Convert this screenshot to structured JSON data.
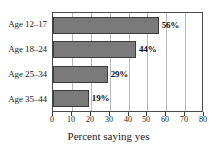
{
  "chart_data": {
    "type": "bar",
    "orientation": "horizontal",
    "title": "",
    "subtitle": "",
    "categories": [
      "Age 12–17",
      "Age 18–24",
      "Age 25–34",
      "Age 35–44"
    ],
    "values": [
      56,
      44,
      29,
      19
    ],
    "value_labels": [
      "56%",
      "44%",
      "29%",
      "19%"
    ],
    "xlabel": "Percent saying yes",
    "ylabel": "",
    "xlim": [
      0,
      80
    ],
    "xticks": [
      0,
      10,
      20,
      30,
      40,
      50,
      60,
      70,
      80
    ],
    "xtick_labels": [
      "0",
      "10",
      "20",
      "30",
      "40",
      "50",
      "60",
      "70",
      "80"
    ],
    "grid": "vertical",
    "legend": "none",
    "bar_color": "#7a7a7a",
    "bar_edge_color": "#3c3c3c",
    "gridline_color": "#b9b9b9",
    "frame_color": "#4a4a4a",
    "background": "#ffffff"
  }
}
